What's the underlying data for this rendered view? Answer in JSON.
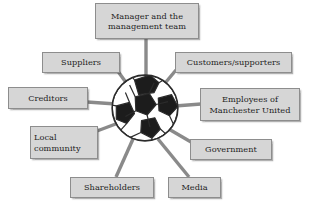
{
  "diagram": {
    "hub": {
      "icon": "football-icon",
      "label": "Football (Manchester United)",
      "center_x": 145,
      "center_y": 108,
      "radius": 32,
      "colors": {
        "panel_dark": "#1c1c1c",
        "panel_light": "#ffffff",
        "outline": "#2b2b2b"
      }
    },
    "style": {
      "box_fill": "#d6d6d6",
      "box_border": "#8d8d8d",
      "connector": "#8a8a8a",
      "text": "#1e1e1e",
      "background": "#ffffff"
    },
    "nodes": [
      {
        "id": "manager",
        "label": "Manager and the management team",
        "line1": "Manager and the",
        "line2": "management team",
        "x": 95,
        "y": 3,
        "w": 104,
        "h": 36,
        "spoke": {
          "x1": 146,
          "y1": 39,
          "x2": 146,
          "y2": 78
        }
      },
      {
        "id": "suppliers",
        "label": "Suppliers",
        "line1": "Suppliers",
        "line2": "",
        "x": 42,
        "y": 52,
        "w": 78,
        "h": 21,
        "spoke": {
          "x1": 117,
          "y1": 70,
          "x2": 130,
          "y2": 88
        }
      },
      {
        "id": "customers-supporters",
        "label": "Customers/supporters",
        "line1": "Customers/supporters",
        "line2": "",
        "x": 175,
        "y": 52,
        "w": 117,
        "h": 21,
        "spoke": {
          "x1": 176,
          "y1": 70,
          "x2": 161,
          "y2": 88
        }
      },
      {
        "id": "creditors",
        "label": "Creditors",
        "line1": "Creditors",
        "line2": "",
        "x": 8,
        "y": 87,
        "w": 80,
        "h": 22,
        "spoke": {
          "x1": 87,
          "y1": 102,
          "x2": 116,
          "y2": 104
        }
      },
      {
        "id": "employees",
        "label": "Employees of Manchester United",
        "line1": "Employees of",
        "line2": "Manchester United",
        "x": 200,
        "y": 88,
        "w": 100,
        "h": 33,
        "spoke": {
          "x1": 201,
          "y1": 104,
          "x2": 175,
          "y2": 106
        }
      },
      {
        "id": "local-community",
        "label": "Local community",
        "line1": "Local",
        "line2": "community",
        "x": 30,
        "y": 126,
        "w": 68,
        "h": 33,
        "spoke": {
          "x1": 97,
          "y1": 131,
          "x2": 121,
          "y2": 122
        }
      },
      {
        "id": "government",
        "label": "Government",
        "line1": "Government",
        "line2": "",
        "x": 190,
        "y": 139,
        "w": 82,
        "h": 21,
        "spoke": {
          "x1": 191,
          "y1": 142,
          "x2": 167,
          "y2": 128
        }
      },
      {
        "id": "shareholders",
        "label": "Shareholders",
        "line1": "Shareholders",
        "line2": "",
        "x": 70,
        "y": 177,
        "w": 84,
        "h": 21,
        "spoke": {
          "x1": 116,
          "y1": 177,
          "x2": 133,
          "y2": 139
        }
      },
      {
        "id": "media",
        "label": "Media",
        "line1": "Media",
        "line2": "",
        "x": 168,
        "y": 177,
        "w": 53,
        "h": 21,
        "spoke": {
          "x1": 189,
          "y1": 177,
          "x2": 158,
          "y2": 139
        }
      }
    ]
  }
}
